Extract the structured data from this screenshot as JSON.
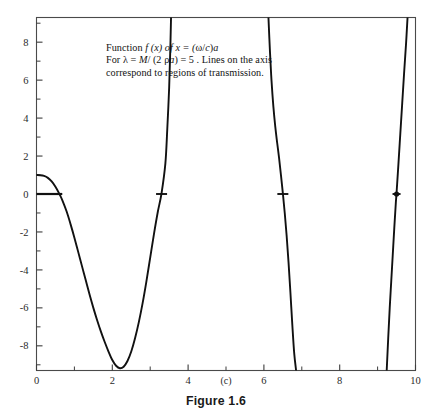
{
  "figure": {
    "caption": "Figure 1.6",
    "panel_label": "(c)"
  },
  "annotation": {
    "line1_pre": "Function ",
    "line1_f": "f",
    "line1_mid": " (x) of  x = (",
    "line1_omega": "ω",
    "line1_slash": "/",
    "line1_c": "c",
    "line1_close": ")",
    "line1_a": "a",
    "line2_pre": "For ",
    "line2_lambda": "λ",
    "line2_eq": " = ",
    "line2_M": "M",
    "line2_div": "/ (2 ",
    "line2_rho": "ρ",
    "line2_a": "a",
    "line2_val": ") = 5 .  Lines on the axis",
    "line3": "correspond to regions of transmission."
  },
  "colors": {
    "curve": "#111111",
    "axis": "#3c3c3c",
    "frame": "#4a4a4a",
    "text": "#121212",
    "marker": "#111111",
    "background": "#ffffff"
  },
  "chart_data": {
    "type": "line",
    "title": "",
    "subtitle": "",
    "xlabel": "(c)",
    "ylabel": "",
    "xlim": [
      0,
      10
    ],
    "ylim": [
      -9.3,
      9.3
    ],
    "grid": false,
    "legend": null,
    "x_ticks_major": [
      0,
      2,
      4,
      6,
      8,
      10
    ],
    "x_ticks_minor": [
      1,
      3,
      5,
      7,
      9
    ],
    "x_tick_labels": [
      "0",
      "2",
      "4",
      "6",
      "8",
      "10"
    ],
    "y_ticks_major": [
      -8,
      -6,
      -4,
      -2,
      0,
      2,
      4,
      6,
      8
    ],
    "y_ticks_minor": [
      -9,
      -7,
      -5,
      -3,
      -1,
      1,
      3,
      5,
      7,
      9
    ],
    "y_tick_labels": [
      "-8",
      "-6",
      "-4",
      "-2",
      "0",
      "2",
      "4",
      "6",
      "8"
    ],
    "asymptotes_x": [
      3.6,
      6.9,
      9.85
    ],
    "zero_crossings": [
      0.68,
      3.3,
      6.5,
      9.5
    ],
    "annotations_on_axis": [
      {
        "kind": "segment",
        "x_start": 0.0,
        "x_end": 0.68,
        "y": 0,
        "label": "transmission-region-1"
      },
      {
        "kind": "tick",
        "x": 3.3,
        "y": 0,
        "label": "transmission-region-2"
      },
      {
        "kind": "tick",
        "x": 6.5,
        "y": 0,
        "label": "transmission-region-3"
      },
      {
        "kind": "dot",
        "x": 9.5,
        "y": 0,
        "label": "transmission-region-4"
      }
    ],
    "series": [
      {
        "name": "f(x)",
        "points": [
          [
            0.0,
            1.0
          ],
          [
            0.1,
            0.99
          ],
          [
            0.2,
            0.95
          ],
          [
            0.3,
            0.85
          ],
          [
            0.4,
            0.66
          ],
          [
            0.5,
            0.38
          ],
          [
            0.6,
            0.02
          ],
          [
            0.68,
            -0.32
          ],
          [
            0.8,
            -0.95
          ],
          [
            0.9,
            -1.6
          ],
          [
            1.0,
            -2.3
          ],
          [
            1.1,
            -3.05
          ],
          [
            1.2,
            -3.8
          ],
          [
            1.3,
            -4.55
          ],
          [
            1.4,
            -5.3
          ],
          [
            1.5,
            -6.0
          ],
          [
            1.6,
            -6.65
          ],
          [
            1.7,
            -7.25
          ],
          [
            1.8,
            -7.8
          ],
          [
            1.9,
            -8.3
          ],
          [
            2.0,
            -8.75
          ],
          [
            2.1,
            -9.05
          ],
          [
            2.2,
            -9.18
          ],
          [
            2.3,
            -9.1
          ],
          [
            2.4,
            -8.8
          ],
          [
            2.5,
            -8.3
          ],
          [
            2.6,
            -7.6
          ],
          [
            2.7,
            -6.75
          ],
          [
            2.8,
            -5.75
          ],
          [
            2.9,
            -4.6
          ],
          [
            3.0,
            -3.35
          ],
          [
            3.1,
            -2.1
          ],
          [
            3.2,
            -0.95
          ],
          [
            3.3,
            0.05
          ],
          [
            3.4,
            1.6
          ],
          [
            3.45,
            3.4
          ],
          [
            3.5,
            5.6
          ],
          [
            3.53,
            7.6
          ],
          [
            3.55,
            9.3
          ],
          [
            6.12,
            9.3
          ],
          [
            6.16,
            7.5
          ],
          [
            6.2,
            6.0
          ],
          [
            6.25,
            4.6
          ],
          [
            6.3,
            3.55
          ],
          [
            6.35,
            2.7
          ],
          [
            6.4,
            1.9
          ],
          [
            6.45,
            1.0
          ],
          [
            6.5,
            0.05
          ],
          [
            6.55,
            -1.0
          ],
          [
            6.6,
            -2.2
          ],
          [
            6.65,
            -3.6
          ],
          [
            6.7,
            -5.2
          ],
          [
            6.75,
            -6.9
          ],
          [
            6.8,
            -8.4
          ],
          [
            6.85,
            -9.3
          ],
          [
            9.24,
            -9.3
          ],
          [
            9.28,
            -7.6
          ],
          [
            9.32,
            -6.0
          ],
          [
            9.36,
            -4.6
          ],
          [
            9.4,
            -3.2
          ],
          [
            9.44,
            -1.8
          ],
          [
            9.48,
            -0.5
          ],
          [
            9.5,
            0.05
          ],
          [
            9.55,
            1.6
          ],
          [
            9.6,
            3.2
          ],
          [
            9.65,
            4.8
          ],
          [
            9.7,
            6.4
          ],
          [
            9.75,
            7.9
          ],
          [
            9.79,
            9.3
          ]
        ]
      }
    ]
  }
}
